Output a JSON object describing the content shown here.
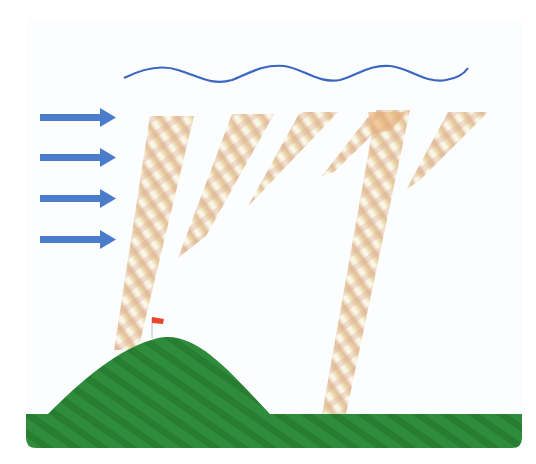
{
  "colors": {
    "background": "#fbfdfe",
    "arrow": "#4a7ccc",
    "wave": "#3a66c0",
    "beam_light": "#f6edc4",
    "beam_dark": "#d9a877",
    "ground": "#2e8a3a",
    "ground_dark": "#22702c",
    "flag": "#e8452c",
    "pole": "#cccccc"
  },
  "arrows": [
    {
      "y": 117,
      "x1": 40,
      "x2": 116
    },
    {
      "y": 157,
      "x1": 40,
      "x2": 116
    },
    {
      "y": 198,
      "x1": 40,
      "x2": 116
    },
    {
      "y": 239,
      "x1": 40,
      "x2": 116
    }
  ],
  "wave": {
    "x1": 124,
    "x2": 468,
    "y": 72,
    "amplitude": 9,
    "cycles": 4
  },
  "beams": [
    {
      "name": "beam-1",
      "points": "150,118 192,118 136,348 114,348"
    },
    {
      "name": "beam-2",
      "points": "232,116 272,116 206,238 180,254"
    },
    {
      "name": "beam-3",
      "points": "300,112 340,112 258,196 248,205"
    },
    {
      "name": "beam-4",
      "points": "373,112 398,112 332,174 322,175"
    },
    {
      "name": "beam-5",
      "points": "376,112 408,112 344,412 322,412"
    },
    {
      "name": "beam-6",
      "points": "448,112 488,112 420,182 406,190"
    }
  ],
  "flag": {
    "pole_x": 154,
    "pole_top": 318,
    "pole_bottom": 338
  }
}
